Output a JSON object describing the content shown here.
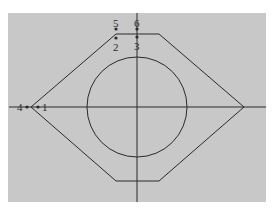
{
  "figure": {
    "background": "#ffffff",
    "panel_color": "#c8c8c8",
    "line_color": "#2a2a2a",
    "labels": [
      {
        "id": "1",
        "text": "1"
      },
      {
        "id": "2",
        "text": "2"
      },
      {
        "id": "3",
        "text": "3"
      },
      {
        "id": "4",
        "text": "4"
      },
      {
        "id": "5",
        "text": "5"
      },
      {
        "id": "6",
        "text": "6"
      }
    ]
  }
}
